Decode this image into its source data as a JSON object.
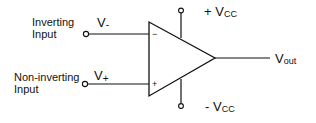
{
  "diagram": {
    "inverting_input": {
      "label_line1": "Inverting",
      "label_line2": "Input",
      "voltage_main": "V",
      "voltage_sub": "-",
      "terminal_sign": "−"
    },
    "noninverting_input": {
      "label_line1": "Non-inverting",
      "label_line2": "Input",
      "voltage_main": "V",
      "voltage_sub": "+",
      "terminal_sign": "+"
    },
    "positive_supply": {
      "sign": "+ ",
      "voltage_main": "V",
      "voltage_sub": "CC"
    },
    "negative_supply": {
      "sign": "- ",
      "voltage_main": "V",
      "voltage_sub": "CC"
    },
    "output": {
      "voltage_main": "V",
      "voltage_sub": "out"
    },
    "colors": {
      "stroke": "#111111",
      "background": "#ffffff"
    }
  }
}
